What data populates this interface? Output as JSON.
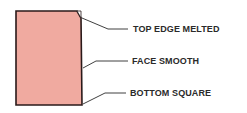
{
  "diagram": {
    "block_fill": "#f0aaa0",
    "line_color": "#2a1a1a",
    "labels": {
      "top": "TOP EDGE MELTED",
      "face": "FACE SMOOTH",
      "bottom": "BOTTOM SQUARE"
    }
  }
}
